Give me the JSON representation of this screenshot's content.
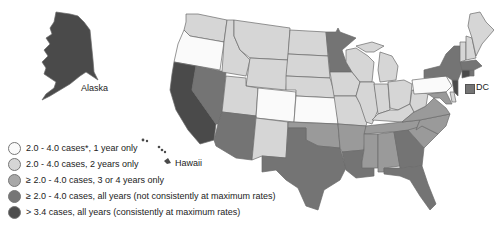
{
  "colors": {
    "white": "#fafafa",
    "light": "#d6d6d6",
    "medium": "#9a9a9a",
    "dark": "#747474",
    "darkest": "#4a4a4a",
    "border": "#6a6a6a"
  },
  "labels": {
    "alaska": "Alaska",
    "hawaii": "Hawaii",
    "dc": "DC"
  },
  "legend": [
    {
      "text": "2.0 - 4.0 cases*, 1 year only",
      "color": "#fafafa"
    },
    {
      "text": "2.0 - 4.0 cases, 2 years only",
      "color": "#d6d6d6"
    },
    {
      "text": "≥ 2.0 - 4.0 cases, 3 or 4 years only",
      "color": "#a8a8a8"
    },
    {
      "text": "≥ 2.0 - 4.0 cases, all years (not consistently at maximum rates)",
      "color": "#767676"
    },
    {
      "text": "> 3.4 cases, all years (consistently at maximum rates)",
      "color": "#4c4c4c"
    }
  ],
  "states": {
    "WA": "light",
    "OR": "white",
    "CA": "darkest",
    "NV": "dark",
    "ID": "light",
    "MT": "light",
    "WY": "light",
    "UT": "light",
    "AZ": "dark",
    "CO": "white",
    "NM": "light",
    "ND": "light",
    "SD": "light",
    "NE": "light",
    "KS": "white",
    "OK": "medium",
    "TX": "dark",
    "MN": "dark",
    "IA": "light",
    "MO": "light",
    "AR": "medium",
    "LA": "dark",
    "WI": "light",
    "IL": "light",
    "MS": "medium",
    "MI": "light",
    "IN": "light",
    "OH": "light",
    "KY": "light",
    "TN": "medium",
    "AL": "medium",
    "GA": "dark",
    "FL": "dark",
    "SC": "medium",
    "NC": "medium",
    "VA": "medium",
    "WV": "light",
    "PA": "white",
    "NY": "dark",
    "NJ": "darkest",
    "MD": "medium",
    "DE": "light",
    "CT": "darkest",
    "RI": "dark",
    "MA": "dark",
    "VT": "light",
    "NH": "light",
    "ME": "light",
    "AK": "darkest",
    "HI": "darkest",
    "DC": "dark"
  }
}
